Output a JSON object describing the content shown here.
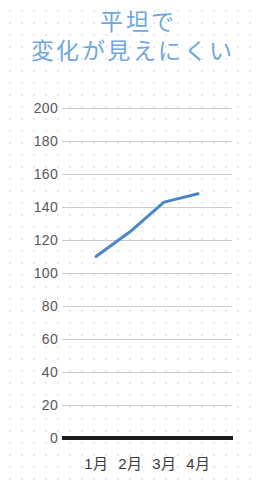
{
  "title": {
    "line1": "平坦で",
    "line2": "変化が見えにくい",
    "color": "#6fa8dc"
  },
  "colors": {
    "title": "#6fa8dc",
    "series_line": "#4a86c8",
    "gridline": "#c9cdd2",
    "axis_baseline": "#1c1c1c",
    "tick_label": "#58585a",
    "background": "#ffffff",
    "dot_grid": "#d9dde4"
  },
  "axis": {
    "y_ticks": [
      "200",
      "180",
      "160",
      "140",
      "120",
      "100",
      "80",
      "60",
      "40",
      "20",
      "0"
    ],
    "x_ticks": [
      "1月",
      "2月",
      "3月",
      "4月"
    ]
  },
  "chart_data": {
    "type": "line",
    "title": "平坦で 変化が見えにくい",
    "subtitle": "",
    "xlabel": "",
    "ylabel": "",
    "categories": [
      "1月",
      "2月",
      "3月",
      "4月"
    ],
    "values": [
      110,
      125,
      143,
      148
    ],
    "series": [
      {
        "name": "series-1",
        "values": [
          110,
          125,
          143,
          148
        ],
        "color": "#4a86c8"
      }
    ],
    "ylim": [
      0,
      200
    ],
    "y_tick_step": 20,
    "y_tick_values": [
      0,
      20,
      40,
      60,
      80,
      100,
      120,
      140,
      160,
      180,
      200
    ],
    "grid": true,
    "grid_axis": "y",
    "legend": false,
    "legend_position": "none",
    "markers": false,
    "annotations": []
  }
}
